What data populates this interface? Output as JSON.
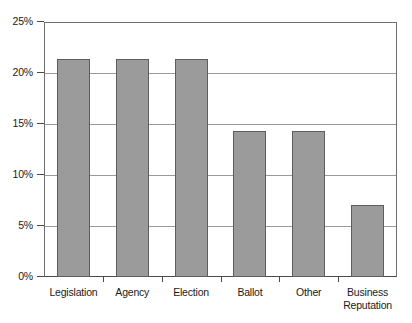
{
  "chart_data": {
    "type": "bar",
    "title": "",
    "xlabel": "",
    "ylabel": "",
    "categories": [
      "Legislation",
      "Agency",
      "Election",
      "Ballot",
      "Other",
      "Business Reputation"
    ],
    "category_lines": [
      [
        "Legislation"
      ],
      [
        "Agency"
      ],
      [
        "Election"
      ],
      [
        "Ballot"
      ],
      [
        "Other"
      ],
      [
        "Business",
        "Reputation"
      ]
    ],
    "values": [
      21.4,
      21.4,
      21.4,
      14.3,
      14.3,
      7.1
    ],
    "value_labels": [
      "21.4%",
      "21.4%",
      "21.4%",
      "14.3%",
      "14.3%",
      "7.1%"
    ],
    "ylim": [
      0,
      25
    ],
    "ytick_values": [
      0,
      5,
      10,
      15,
      20,
      25
    ],
    "ytick_labels": [
      "0%",
      "5%",
      "10%",
      "15%",
      "20%",
      "25%"
    ],
    "grid": true,
    "grid_axis": "y",
    "legend": false,
    "legend_position": "none",
    "bar_color": "#9b9b9b",
    "bar_border_color": "#5d5d5d",
    "grid_color": "#9a9a9a",
    "axis_color": "#4a4a4a",
    "background_color": "#ffffff"
  }
}
